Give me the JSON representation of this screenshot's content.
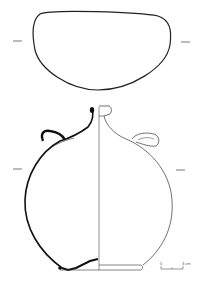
{
  "figure": {
    "views": [
      "top-view",
      "side-section-view"
    ],
    "line_color": "#222222",
    "background": "#ffffff"
  },
  "scale_bar": {
    "start_label": "0",
    "end_label": "3 cm"
  }
}
